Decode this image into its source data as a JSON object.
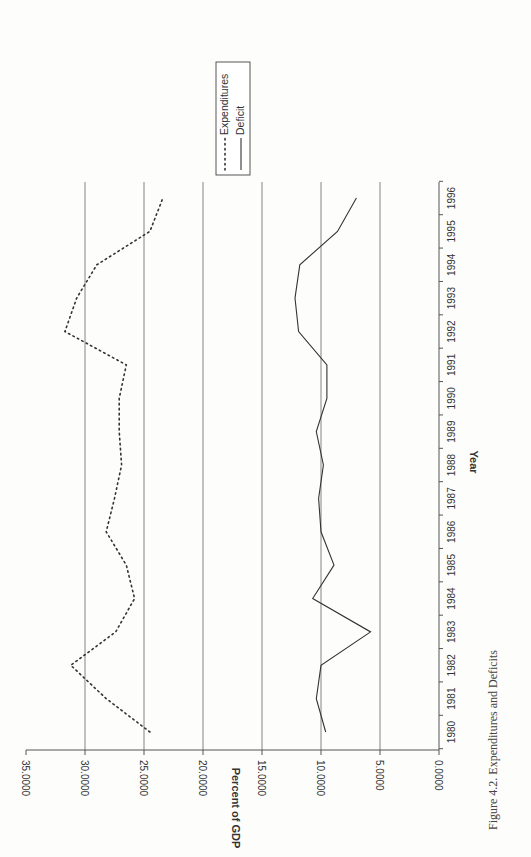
{
  "caption": "Figure 4.2. Expenditures and Deficits",
  "chart_data": {
    "type": "line",
    "title": "",
    "caption": "Figure 4.2. Expenditures and Deficits",
    "orientation_note": "page rotated 90 degrees counter-clockwise",
    "xlabel": "Year",
    "ylabel": "Percent of GDP",
    "x": [
      1980,
      1981,
      1982,
      1983,
      1984,
      1985,
      1986,
      1987,
      1988,
      1989,
      1990,
      1991,
      1992,
      1993,
      1994,
      1995,
      1996
    ],
    "ylim": [
      0,
      35
    ],
    "yticks": [
      "0.0000",
      "5.0000",
      "10.0000",
      "15.0000",
      "20.0000",
      "25.0000",
      "30.0000",
      "35.0000"
    ],
    "grid": true,
    "legend_position": "upper-right (top of rotated page)",
    "series": [
      {
        "name": "Expenditures",
        "style": "dotted",
        "color": "#333333",
        "values": [
          24.5,
          28.2,
          31.2,
          27.4,
          25.8,
          26.5,
          28.2,
          27.5,
          26.9,
          27.1,
          27.1,
          26.5,
          31.7,
          30.7,
          29.0,
          24.5,
          23.4
        ]
      },
      {
        "name": "Deficit",
        "style": "solid",
        "color": "#333333",
        "values": [
          9.6,
          10.4,
          10.0,
          5.8,
          10.7,
          8.9,
          10.0,
          10.2,
          9.8,
          10.4,
          9.5,
          9.5,
          11.9,
          12.2,
          11.8,
          8.6,
          7.0
        ]
      }
    ]
  }
}
